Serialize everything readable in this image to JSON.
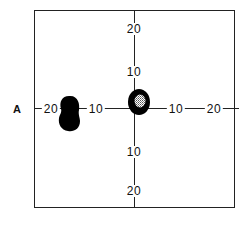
{
  "figure": {
    "eye_label": "A",
    "horizontal_ticks": [
      {
        "label": "20",
        "side": "left"
      },
      {
        "label": "10",
        "side": "left"
      },
      {
        "label": "10",
        "side": "right"
      },
      {
        "label": "20",
        "side": "right"
      }
    ],
    "vertical_ticks": [
      {
        "label": "20",
        "side": "top"
      },
      {
        "label": "10",
        "side": "top"
      },
      {
        "label": "10",
        "side": "bottom"
      },
      {
        "label": "20",
        "side": "bottom"
      }
    ],
    "features": [
      {
        "name": "blind-spot",
        "description": "solid black kidney-shaped scotoma near 15-20 degrees temporal (left)",
        "fill": "#000000"
      },
      {
        "name": "central-scotoma",
        "description": "black ring around fixation with stippled center, slightly up-right of center",
        "fill": "#000000",
        "center_fill": "stippled"
      }
    ],
    "colors": {
      "ink": "#111111",
      "background": "#ffffff"
    }
  }
}
